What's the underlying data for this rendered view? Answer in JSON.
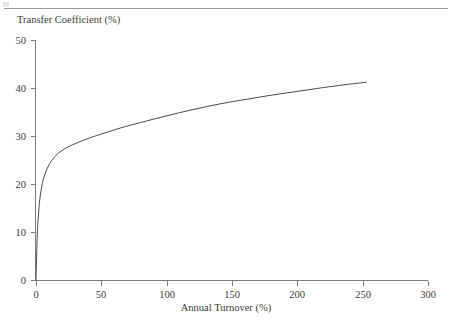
{
  "figure": {
    "top_rule_color": "#9a9a9a",
    "axis_color": "#7d7d7d",
    "curve_color": "#4a4a4a",
    "text_color": "#3c3c3c"
  },
  "chart_data": {
    "type": "line",
    "title": "",
    "xlabel": "Annual Turnover (%)",
    "ylabel": "Transfer Coefficient (%)",
    "xlim": [
      0,
      300
    ],
    "ylim": [
      0,
      50
    ],
    "xticks": [
      0,
      50,
      100,
      150,
      200,
      250,
      300
    ],
    "xtick_labels": [
      "0",
      "50",
      "100",
      "150",
      "200",
      "250",
      "300"
    ],
    "yticks": [
      0,
      10,
      20,
      30,
      40,
      50
    ],
    "ytick_labels": [
      "0",
      "10",
      "20",
      "30",
      "40",
      "50"
    ],
    "grid": false,
    "legend": "none",
    "spines": [
      "left",
      "bottom"
    ],
    "tick_direction": "out",
    "series": [
      {
        "name": "Transfer Coefficient",
        "x": [
          0,
          1,
          2,
          3,
          5,
          8,
          12,
          17,
          23,
          30,
          40,
          50,
          65,
          80,
          100,
          120,
          141,
          160,
          180,
          200,
          220,
          240,
          253
        ],
        "y": [
          0,
          9.5,
          14.0,
          17.0,
          20.3,
          22.9,
          24.9,
          26.4,
          27.5,
          28.4,
          29.5,
          30.4,
          31.7,
          32.8,
          34.2,
          35.5,
          36.7,
          37.6,
          38.5,
          39.3,
          40.1,
          40.8,
          41.2
        ]
      }
    ],
    "annotations": []
  }
}
